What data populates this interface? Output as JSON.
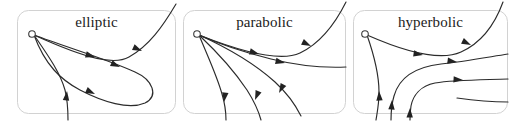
{
  "figure": {
    "background_color": "#ffffff",
    "curve_color": "#2b2b2b",
    "frame_color": "#d2d2d2",
    "panel_count": 3
  },
  "panels": [
    {
      "id": "elliptic",
      "label": "elliptic",
      "singular_point_marker": "open-circle",
      "singular_point": {
        "x": 15,
        "y": 24
      },
      "description": "elliptic sector: trajectories leave and return to the singular point forming a loop",
      "curve_count": 5,
      "arrow_count": 5,
      "has_loop": true
    },
    {
      "id": "parabolic",
      "label": "parabolic",
      "singular_point_marker": "open-circle",
      "singular_point": {
        "x": 14,
        "y": 24
      },
      "description": "parabolic sector: trajectories approach the singular point from one side and escape",
      "curve_count": 5,
      "arrow_count": 5,
      "has_loop": false
    },
    {
      "id": "hyperbolic",
      "label": "hyperbolic",
      "singular_point_marker": "open-circle",
      "singular_point": {
        "x": 12,
        "y": 24
      },
      "description": "hyperbolic sector: trajectories pass by the singular point without reaching it",
      "curve_count": 6,
      "arrow_count": 6,
      "has_loop": false
    }
  ]
}
